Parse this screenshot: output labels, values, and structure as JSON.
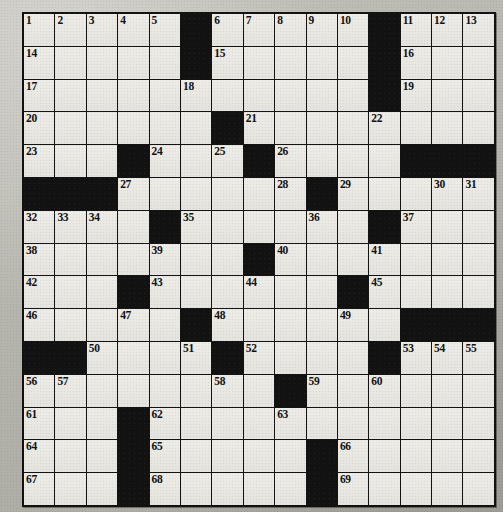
{
  "puzzle": {
    "type": "crossword-grid",
    "rows": 15,
    "cols": 15,
    "colors": {
      "paper": "#b9b8b0",
      "white_cell": "#e9e8e3",
      "black_cell": "#121212",
      "grid_line": "#131313",
      "number_text": "#111111"
    },
    "legend": {
      "white": "open letter square",
      "black": "blocked square"
    },
    "cells": [
      [
        "1",
        "2",
        "3",
        "4",
        "5",
        "#",
        "6",
        "7",
        "8",
        "9",
        "10",
        "#",
        "11",
        "12",
        "13"
      ],
      [
        "14",
        "",
        "",
        "",
        "",
        "#",
        "15",
        "",
        "",
        "",
        "",
        "#",
        "16",
        "",
        ""
      ],
      [
        "17",
        "",
        "",
        "",
        "",
        "18",
        "",
        "",
        "",
        "",
        "",
        "#",
        "19",
        "",
        ""
      ],
      [
        "20",
        "",
        "",
        "",
        "",
        "",
        "#",
        "21",
        "",
        "",
        "",
        "22",
        "",
        "",
        ""
      ],
      [
        "23",
        "",
        "",
        "#",
        "24",
        "",
        "25",
        "#",
        "26",
        "",
        "",
        "",
        "#",
        "#",
        "#"
      ],
      [
        "#",
        "#",
        "#",
        "27",
        "",
        "",
        "",
        "",
        "28",
        "#",
        "29",
        "",
        "",
        "30",
        "31"
      ],
      [
        "32",
        "33",
        "34",
        "",
        "#",
        "35",
        "",
        "",
        "",
        "36",
        "",
        "#",
        "37",
        "",
        ""
      ],
      [
        "38",
        "",
        "",
        "",
        "39",
        "",
        "",
        "#",
        "40",
        "",
        "",
        "41",
        "",
        "",
        ""
      ],
      [
        "42",
        "",
        "",
        "#",
        "43",
        "",
        "",
        "44",
        "",
        "",
        "#",
        "45",
        "",
        "",
        ""
      ],
      [
        "46",
        "",
        "",
        "47",
        "",
        "#",
        "48",
        "",
        "",
        "",
        "49",
        "",
        "#",
        "#",
        "#"
      ],
      [
        "#",
        "#",
        "50",
        "",
        "",
        "51",
        "#",
        "52",
        "",
        "",
        "",
        "#",
        "53",
        "54",
        "55"
      ],
      [
        "56",
        "57",
        "",
        "",
        "",
        "",
        "58",
        "",
        "#",
        "59",
        "",
        "60",
        "",
        "",
        ""
      ],
      [
        "61",
        "",
        "",
        "#",
        "62",
        "",
        "",
        "",
        "63",
        "",
        "",
        "",
        "",
        "",
        ""
      ],
      [
        "64",
        "",
        "",
        "#",
        "65",
        "",
        "",
        "",
        "",
        "#",
        "66",
        "",
        "",
        "",
        ""
      ],
      [
        "67",
        "",
        "",
        "#",
        "68",
        "",
        "",
        "",
        "",
        "#",
        "69",
        "",
        "",
        "",
        ""
      ]
    ]
  }
}
